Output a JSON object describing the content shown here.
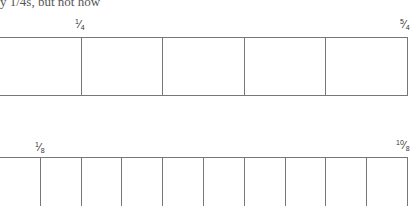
{
  "header": {
    "cut_text": "y 1/4s, but not how"
  },
  "top_strip": {
    "cells": 5,
    "label_left": {
      "num": "1",
      "den": "4"
    },
    "label_right": {
      "num": "5",
      "den": "4"
    }
  },
  "bottom_strip": {
    "cells": 10,
    "label_left": {
      "num": "1",
      "den": "8"
    },
    "label_right": {
      "num": "10",
      "den": "8"
    }
  }
}
